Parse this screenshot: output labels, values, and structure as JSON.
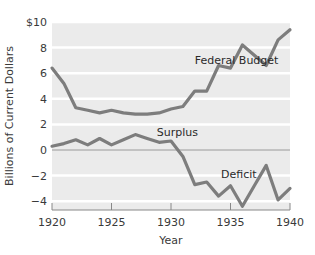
{
  "chart_data": {
    "type": "line",
    "title": "",
    "xlabel": "Year",
    "ylabel": "Billions of Current Dollars",
    "xlim": [
      1920,
      1940
    ],
    "ylim": [
      -5,
      10
    ],
    "grid": true,
    "x_ticks": [
      1920,
      1925,
      1930,
      1935,
      1940
    ],
    "y_ticks": [
      {
        "value": 10,
        "label": "$10"
      },
      {
        "value": 8,
        "label": "8"
      },
      {
        "value": 6,
        "label": "6"
      },
      {
        "value": 4,
        "label": "4"
      },
      {
        "value": 2,
        "label": "2"
      },
      {
        "value": 0,
        "label": "0"
      },
      {
        "value": -2,
        "label": "−2"
      },
      {
        "value": -4,
        "label": "−4"
      }
    ],
    "x": [
      1920,
      1921,
      1922,
      1923,
      1924,
      1925,
      1926,
      1927,
      1928,
      1929,
      1930,
      1931,
      1932,
      1933,
      1934,
      1935,
      1936,
      1937,
      1938,
      1939,
      1940
    ],
    "series": [
      {
        "name": "Federal Budget",
        "values": [
          6.4,
          5.2,
          3.3,
          3.1,
          2.9,
          3.1,
          2.9,
          2.8,
          2.8,
          2.9,
          3.2,
          3.4,
          4.6,
          4.6,
          6.6,
          6.4,
          8.2,
          7.4,
          6.6,
          8.6,
          9.4
        ]
      },
      {
        "name": "Surplus / Deficit",
        "values": [
          0.3,
          0.5,
          0.8,
          0.4,
          0.9,
          0.4,
          0.8,
          1.2,
          0.9,
          0.6,
          0.7,
          -0.5,
          -2.7,
          -2.5,
          -3.6,
          -2.8,
          -4.4,
          -2.8,
          -1.2,
          -3.9,
          -3.0
        ]
      }
    ],
    "annotations": [
      {
        "text": "Federal Budget",
        "x": 1932.0,
        "y": 7.0
      },
      {
        "text": "Surplus",
        "x": 1928.8,
        "y": 1.4
      },
      {
        "text": "Deficit",
        "x": 1934.2,
        "y": -1.9
      }
    ],
    "colors": {
      "plot_bg": "#ebebeb",
      "gridline": "#ffffff",
      "line": "#7d7d7d",
      "zero_line": "#9a9a9a",
      "axis": "#888888"
    }
  }
}
